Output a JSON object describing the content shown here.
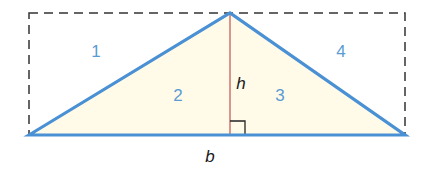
{
  "diagram": {
    "colors": {
      "triangle_stroke": "#4a90d4",
      "triangle_fill": "#fffbe8",
      "height_line": "#c0504d",
      "dashed_rect": "#333333",
      "region_label": "#5a9bd5",
      "right_angle_mark": "#222222"
    },
    "region_labels": [
      "1",
      "2",
      "3",
      "4"
    ],
    "height_label": "h",
    "base_label": "b"
  }
}
